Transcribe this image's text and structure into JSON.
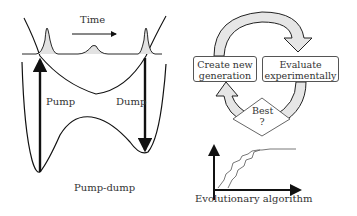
{
  "left_panel": {
    "time_label": "Time",
    "pump_label": "Pump",
    "dump_label": "Dump",
    "caption": "Pump-dump"
  },
  "right_panel": {
    "box_create": {
      "line1": "Create new",
      "line2": "generation"
    },
    "box_evaluate": {
      "line1": "Evaluate",
      "line2": "experimentally"
    },
    "decision": {
      "line1": "Best",
      "line2": "?"
    },
    "caption": "Evolutionary algorithm"
  },
  "colors": {
    "stroke": "#111111",
    "arrow_fill": "#e6e6e6",
    "pulse_fill": "#dddddd",
    "text": "#333333"
  }
}
